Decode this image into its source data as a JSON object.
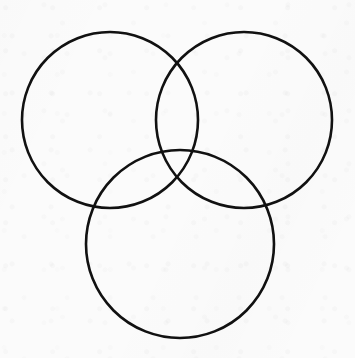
{
  "figure": {
    "title": "Three-circle Venn diagram",
    "kind": "venn-diagram",
    "background_color": "#fbfbfb",
    "stroke_color": "#111111",
    "stroke_width": 2.6,
    "fill": "none",
    "canvas": {
      "width": 355,
      "height": 358
    }
  },
  "chart_data": {
    "type": "diagram",
    "subtype": "venn",
    "title": "Three-circle Venn diagram",
    "xlabel": "",
    "ylabel": "",
    "set_count": 3,
    "region_count": 7,
    "labels_present": false,
    "legend": [],
    "annotations": [],
    "grid": false,
    "axis_visible": false,
    "xlim": [
      0,
      355
    ],
    "ylim": [
      0,
      358
    ],
    "circles": [
      {
        "name": "top-left-circle",
        "cx": 110,
        "cy": 120,
        "r": 88
      },
      {
        "name": "top-right-circle",
        "cx": 244,
        "cy": 120,
        "r": 88
      },
      {
        "name": "bottom-circle",
        "cx": 180,
        "cy": 244,
        "r": 94
      }
    ],
    "intersections": [
      {
        "name": "top-left-and-top-right-upper",
        "x": 177,
        "y": 48
      },
      {
        "name": "top-left-and-top-right-lower",
        "x": 177,
        "y": 192
      },
      {
        "name": "top-left-and-bottom-left",
        "x": 92,
        "y": 214
      },
      {
        "name": "top-left-and-bottom-right",
        "x": 197,
        "y": 161
      },
      {
        "name": "top-right-and-bottom-left",
        "x": 157,
        "y": 161
      },
      {
        "name": "top-right-and-bottom-right",
        "x": 268,
        "y": 214
      }
    ],
    "extents": {
      "top-left-circle": {
        "left": 22,
        "right": 198,
        "top": 32,
        "bottom": 208
      },
      "top-right-circle": {
        "left": 156,
        "right": 332,
        "top": 32,
        "bottom": 208
      },
      "bottom-circle": {
        "left": 86,
        "right": 274,
        "top": 150,
        "bottom": 338
      }
    }
  }
}
